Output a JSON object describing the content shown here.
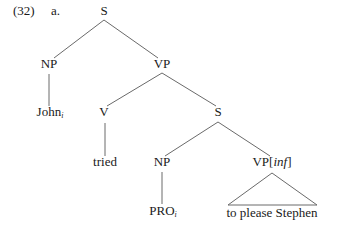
{
  "example": {
    "number": "(32)",
    "letter": "a."
  },
  "tree": {
    "root": {
      "label": "S"
    },
    "np_subject": {
      "label": "NP"
    },
    "vp_main": {
      "label": "VP"
    },
    "john": {
      "word": "John",
      "index": "i"
    },
    "v": {
      "label": "V"
    },
    "s_embedded": {
      "label": "S"
    },
    "tried": {
      "word": "tried"
    },
    "np_embedded": {
      "label": "NP"
    },
    "vp_inf": {
      "label": "VP[",
      "feature": "inf",
      "close": "]"
    },
    "pro": {
      "word": "PRO",
      "index": "i"
    },
    "vp_inf_yield": {
      "text": "to please Stephen"
    }
  },
  "colors": {
    "text": "#1a1a1a",
    "edge": "#6a6a6a",
    "background": "#ffffff"
  }
}
